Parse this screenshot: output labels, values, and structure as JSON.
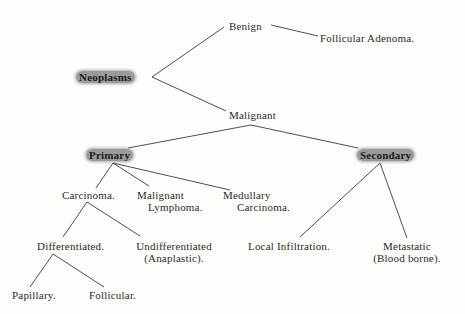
{
  "diagram": {
    "title_fragment": "",
    "root": "Neoplasms",
    "nodes": {
      "neoplasms": "Neoplasms",
      "benign": "Benign",
      "follicular_adenoma": "Follicular Adenoma.",
      "malignant": "Malignant",
      "primary": "Primary",
      "secondary": "Secondary",
      "carcinoma": "Carcinoma.",
      "malignant_lymphoma_1": "Malignant",
      "malignant_lymphoma_2": "Lymphoma.",
      "medullary_carcinoma_1": "Medullary",
      "medullary_carcinoma_2": "Carcinoma.",
      "differentiated": "Differentiated.",
      "undifferentiated_1": "Undifferentiated",
      "undifferentiated_2": "(Anaplastic).",
      "local_infiltration": "Local Infiltration.",
      "metastatic_1": "Metastatic",
      "metastatic_2": "(Blood borne).",
      "papillary": "Papillary.",
      "follicular": "Follicular."
    },
    "edges": [
      [
        "Neoplasms",
        "Benign"
      ],
      [
        "Neoplasms",
        "Malignant"
      ],
      [
        "Benign",
        "Follicular Adenoma."
      ],
      [
        "Malignant",
        "Primary"
      ],
      [
        "Malignant",
        "Secondary"
      ],
      [
        "Primary",
        "Carcinoma."
      ],
      [
        "Primary",
        "Malignant Lymphoma."
      ],
      [
        "Primary",
        "Medullary Carcinoma."
      ],
      [
        "Carcinoma.",
        "Differentiated."
      ],
      [
        "Carcinoma.",
        "Undifferentiated (Anaplastic)."
      ],
      [
        "Differentiated.",
        "Papillary."
      ],
      [
        "Differentiated.",
        "Follicular."
      ],
      [
        "Secondary",
        "Local Infiltration."
      ],
      [
        "Secondary",
        "Metastatic (Blood borne)."
      ]
    ],
    "highlighted_nodes": [
      "Neoplasms",
      "Primary",
      "Secondary"
    ],
    "colors": {
      "text": "#2b2b2b",
      "highlight": "#9a9a9a",
      "lines": "#3a3a3a"
    }
  }
}
